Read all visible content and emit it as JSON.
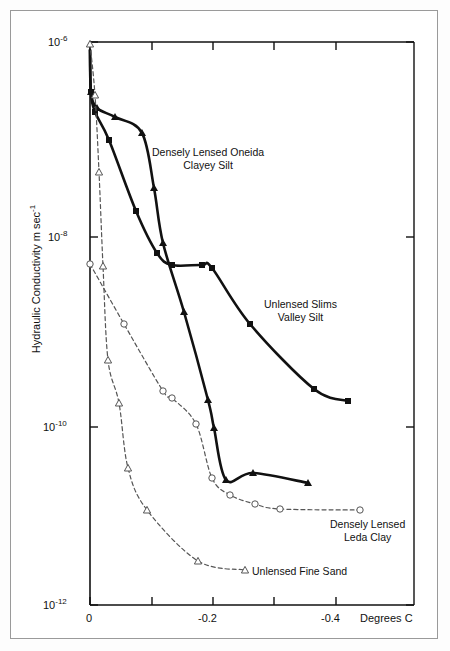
{
  "figure": {
    "background_color": "#ffffff",
    "frame_color": "#9a9a9a",
    "axis_color": "#111111"
  },
  "axes": {
    "y_title": "Hydraulic Conductivity  m sec",
    "y_title_exponent": "-1",
    "x_title": "Degrees C",
    "y_tick_labels": [
      {
        "mantissa": "10",
        "exponent": "-6",
        "value": 1e-06,
        "py": 42
      },
      {
        "mantissa": "10",
        "exponent": "-8",
        "value": 1e-08,
        "py": 237
      },
      {
        "mantissa": "10",
        "exponent": "-10",
        "value": 1e-10,
        "py": 427
      },
      {
        "mantissa": "10",
        "exponent": "-12",
        "value": 1e-12,
        "py": 605
      }
    ],
    "x_tick_labels": [
      {
        "label": "0",
        "value": 0,
        "px": 90
      },
      {
        "label": "",
        "value": -0.1,
        "px": 152
      },
      {
        "label": "-0.2",
        "value": -0.2,
        "px": 213
      },
      {
        "label": "",
        "value": -0.3,
        "px": 274
      },
      {
        "label": "-0.4",
        "value": -0.4,
        "px": 336
      }
    ]
  },
  "chart_data": {
    "type": "line",
    "title": "",
    "xlabel": "Degrees C",
    "ylabel": "Hydraulic Conductivity m sec-1",
    "xlim": [
      0.02,
      -0.47
    ],
    "ylim": [
      1e-12,
      1e-06
    ],
    "yscale": "log",
    "grid": false,
    "legend": "inline-annotations",
    "series": [
      {
        "name": "Densely Lensed Oneida Clayey Silt",
        "style": "solid",
        "marker": "triangle",
        "color": "#111111",
        "label_text": [
          "Densely Lensed Oneida",
          "Clayey Silt"
        ],
        "label_px": 152,
        "label_py": 146,
        "points": [
          {
            "x": 0.0,
            "y": 8e-07,
            "px": 90,
            "py": 50
          },
          {
            "x": 0.002,
            "y": 2.6e-07,
            "px": 91,
            "py": 92
          },
          {
            "x": -0.01,
            "y": 1.3e-07,
            "px": 97,
            "py": 108
          },
          {
            "x": -0.04,
            "y": 1e-07,
            "px": 115,
            "py": 117
          },
          {
            "x": -0.085,
            "y": 6e-08,
            "px": 142,
            "py": 133
          },
          {
            "x": -0.105,
            "y": 2e-08,
            "px": 154,
            "py": 188
          },
          {
            "x": -0.12,
            "y": 9e-09,
            "px": 163,
            "py": 243
          },
          {
            "x": -0.155,
            "y": 1.6e-09,
            "px": 184,
            "py": 312
          },
          {
            "x": -0.195,
            "y": 2.2e-10,
            "px": 208,
            "py": 400
          },
          {
            "x": -0.205,
            "y": 1e-10,
            "px": 214,
            "py": 428
          },
          {
            "x": -0.225,
            "y": 2.2e-11,
            "px": 226,
            "py": 480
          },
          {
            "x": -0.27,
            "y": 1.5e-11,
            "px": 253,
            "py": 473
          },
          {
            "x": -0.355,
            "y": 1e-11,
            "px": 308,
            "py": 483
          }
        ]
      },
      {
        "name": "Unlensed Slims Valley Silt",
        "style": "solid",
        "marker": "square",
        "color": "#111111",
        "label_text": [
          "Unlensed Slims",
          "Valley Silt"
        ],
        "label_px": 264,
        "label_py": 298,
        "points": [
          {
            "x": 0.0,
            "y": 8e-07,
            "px": 90,
            "py": 50
          },
          {
            "x": 0.002,
            "y": 2.6e-07,
            "px": 91,
            "py": 92
          },
          {
            "x": -0.008,
            "y": 1.1e-07,
            "px": 95,
            "py": 112
          },
          {
            "x": -0.03,
            "y": 5e-08,
            "px": 109,
            "py": 140
          },
          {
            "x": -0.075,
            "y": 1.3e-08,
            "px": 136,
            "py": 211
          },
          {
            "x": -0.11,
            "y": 6e-09,
            "px": 157,
            "py": 253
          },
          {
            "x": -0.135,
            "y": 4e-09,
            "px": 172,
            "py": 265
          },
          {
            "x": -0.185,
            "y": 4e-09,
            "px": 202,
            "py": 265
          },
          {
            "x": -0.2,
            "y": 3.8e-09,
            "px": 212,
            "py": 268
          },
          {
            "x": -0.265,
            "y": 9e-10,
            "px": 250,
            "py": 324
          },
          {
            "x": -0.37,
            "y": 1e-10,
            "px": 314,
            "py": 389
          },
          {
            "x": -0.425,
            "y": 5e-11,
            "px": 348,
            "py": 401
          }
        ]
      },
      {
        "name": "Densely Lensed Leda Clay",
        "style": "dashed",
        "marker": "circle-open",
        "color": "#555555",
        "label_text": [
          "Densely Lensed",
          "Leda Clay"
        ],
        "label_px": 330,
        "label_py": 518,
        "points": [
          {
            "x": 0.0,
            "y": 3.5e-09,
            "px": 90,
            "py": 264
          },
          {
            "x": -0.055,
            "y": 8e-10,
            "px": 124,
            "py": 324
          },
          {
            "x": -0.12,
            "y": 2e-10,
            "px": 163,
            "py": 391
          },
          {
            "x": -0.135,
            "y": 1.7e-10,
            "px": 172,
            "py": 398
          },
          {
            "x": -0.175,
            "y": 9e-11,
            "px": 196,
            "py": 424
          },
          {
            "x": -0.2,
            "y": 2.5e-11,
            "px": 212,
            "py": 478
          },
          {
            "x": -0.23,
            "y": 1.4e-11,
            "px": 230,
            "py": 495
          },
          {
            "x": -0.27,
            "y": 1e-11,
            "px": 255,
            "py": 504
          },
          {
            "x": -0.31,
            "y": 7e-12,
            "px": 280,
            "py": 509
          },
          {
            "x": -0.44,
            "y": 5e-12,
            "px": 360,
            "py": 510
          }
        ]
      },
      {
        "name": "Unlensed Fine Sand",
        "style": "dashed",
        "marker": "triangle-open",
        "color": "#555555",
        "label_text": [
          "Unlensed Fine Sand"
        ],
        "label_px": 252,
        "label_py": 565,
        "points": [
          {
            "x": 0.0,
            "y": 1e-06,
            "px": 90,
            "py": 44
          },
          {
            "x": -0.008,
            "y": 2.5e-07,
            "px": 95,
            "py": 95
          },
          {
            "x": -0.015,
            "y": 3e-08,
            "px": 99,
            "py": 172
          },
          {
            "x": -0.022,
            "y": 4e-09,
            "px": 103,
            "py": 266
          },
          {
            "x": -0.03,
            "y": 5e-10,
            "px": 108,
            "py": 360
          },
          {
            "x": -0.048,
            "y": 1.6e-10,
            "px": 119,
            "py": 403
          },
          {
            "x": -0.062,
            "y": 3.5e-11,
            "px": 128,
            "py": 468
          },
          {
            "x": -0.092,
            "y": 1.4e-11,
            "px": 147,
            "py": 510
          },
          {
            "x": -0.175,
            "y": 3e-12,
            "px": 198,
            "py": 561
          },
          {
            "x": -0.25,
            "y": 2.4e-12,
            "px": 245,
            "py": 570
          }
        ]
      }
    ]
  }
}
